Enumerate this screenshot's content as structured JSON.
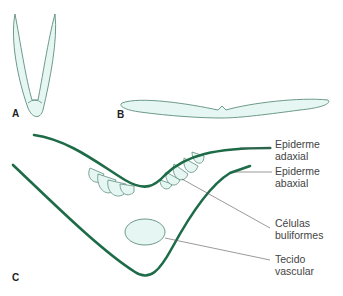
{
  "diagram": {
    "type": "botanical leaf cross-section illustration",
    "colors": {
      "leaf_fill": "#e6f6f3",
      "leaf_outline": "#5e8f7d",
      "epidermis_stroke": "#1e6b48",
      "leader_line": "#555555",
      "label_text": "#444444"
    },
    "panels": [
      {
        "id": "A",
        "label": "A",
        "description": "folded (closed) leaf"
      },
      {
        "id": "B",
        "label": "B",
        "description": "open (expanded) leaf"
      },
      {
        "id": "C",
        "label": "C",
        "description": "detail of midrib region"
      }
    ],
    "labels": [
      {
        "id": "adaxial",
        "line1": "Epiderme",
        "line2": "adaxial"
      },
      {
        "id": "abaxial",
        "line1": "Epiderme",
        "line2": "abaxial"
      },
      {
        "id": "bulliform",
        "line1": "Células",
        "line2": "buliformes"
      },
      {
        "id": "vascular",
        "line1": "Tecido",
        "line2": "vascular"
      }
    ]
  }
}
